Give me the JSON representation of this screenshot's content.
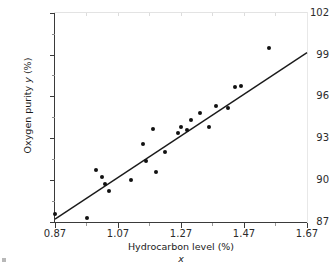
{
  "chart_data": {
    "type": "scatter",
    "title": "",
    "xlabel": "Hydrocarbon level (%)",
    "xlabel_symbol": "x",
    "ylabel": "Oxygen purity y (%)",
    "xlim": [
      0.87,
      1.67
    ],
    "ylim": [
      87,
      102
    ],
    "xticks": [
      "0.87",
      "1.07",
      "1.27",
      "1.47",
      "1.67"
    ],
    "xtick_values": [
      0.87,
      1.07,
      1.27,
      1.47,
      1.67
    ],
    "yticks": [
      "87",
      "90",
      "93",
      "96",
      "99",
      "102"
    ],
    "ytick_values": [
      87,
      90,
      93,
      96,
      99,
      102
    ],
    "grid": false,
    "legend": null,
    "series": [
      {
        "name": "observations",
        "type": "scatter",
        "marker": "filled-circle",
        "color": "#111111",
        "x": [
          0.87,
          0.97,
          1.0,
          1.02,
          1.03,
          1.04,
          1.11,
          1.15,
          1.16,
          1.18,
          1.19,
          1.22,
          1.26,
          1.27,
          1.29,
          1.3,
          1.33,
          1.36,
          1.38,
          1.42,
          1.44,
          1.46,
          1.55
        ],
        "y": [
          87.6,
          87.3,
          90.7,
          90.2,
          89.7,
          89.2,
          90.0,
          92.6,
          91.4,
          93.7,
          90.6,
          92.0,
          93.4,
          93.8,
          93.6,
          94.3,
          94.8,
          93.8,
          95.3,
          95.2,
          96.7,
          96.8,
          99.5
        ]
      },
      {
        "name": "least-squares regression line",
        "type": "line",
        "color": "#1a1a1a",
        "x_endpoints": [
          0.87,
          1.67
        ],
        "y_endpoints": [
          87.2,
          99.15
        ]
      }
    ],
    "points_pixels": [
      {
        "px": 54,
        "py": 217
      },
      {
        "px": 71,
        "py": 221
      },
      {
        "px": 86,
        "py": 174
      },
      {
        "px": 84,
        "py": 182
      },
      {
        "px": 90,
        "py": 188
      },
      {
        "px": 92,
        "py": 193
      },
      {
        "px": 113,
        "py": 180
      },
      {
        "px": 135,
        "py": 145
      },
      {
        "px": 145,
        "py": 161
      },
      {
        "px": 147,
        "py": 133
      },
      {
        "px": 148,
        "py": 177
      },
      {
        "px": 160,
        "py": 155
      },
      {
        "px": 174,
        "py": 127
      },
      {
        "px": 180,
        "py": 125
      },
      {
        "px": 186,
        "py": 128
      },
      {
        "px": 190,
        "py": 123
      },
      {
        "px": 205,
        "py": 128
      },
      {
        "px": 212,
        "py": 119
      },
      {
        "px": 224,
        "py": 119
      },
      {
        "px": 233,
        "py": 110
      },
      {
        "px": 241,
        "py": 89
      },
      {
        "px": 248,
        "py": 120
      },
      {
        "px": 268,
        "py": 50
      }
    ]
  },
  "axis": {
    "y_title": "Oxygen purity",
    "y_title_symbol": "y",
    "y_title_unit": "(%)",
    "x_title": "Hydrocarbon level (%)",
    "x_symbol": "x"
  }
}
